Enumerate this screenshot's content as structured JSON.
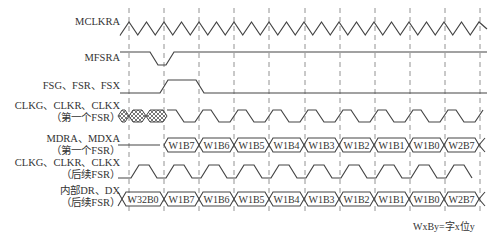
{
  "diagram": {
    "title": "",
    "colors": {
      "line": "#444444",
      "dash": "#777777",
      "hatch": "#555555",
      "background": "#ffffff"
    },
    "grid": {
      "dashed_x": [
        129,
        164,
        199,
        234,
        269,
        305,
        340,
        375,
        410,
        445,
        480
      ],
      "y_top": 8,
      "y_bottom": 214
    },
    "signals": [
      {
        "id": "mclkra",
        "label": "MCLKRA",
        "sublabel": "",
        "type": "triangle-clock",
        "label_y": 16
      },
      {
        "id": "mfsra",
        "label": "MFSRA",
        "sublabel": "",
        "type": "pulse-low",
        "label_y": 52
      },
      {
        "id": "fsg",
        "label": "FSG、FSR、FSX",
        "sublabel": "",
        "type": "pulse-high",
        "label_y": 80
      },
      {
        "id": "clk-first",
        "label": "CLKG、CLKR、CLKX",
        "sublabel": "（第一个FSR）",
        "type": "clock-hatched",
        "label_y": 100
      },
      {
        "id": "mdra",
        "label": "MDRA、MDXA",
        "sublabel": "（第一个FSR）",
        "type": "bus",
        "label_y": 136
      },
      {
        "id": "clk-later",
        "label": "CLKG、CLKR、CLKX",
        "sublabel": "（后续FSR）",
        "type": "clock",
        "label_y": 161
      },
      {
        "id": "internal-dr",
        "label": "内部DR、DX",
        "sublabel": "（后续FSR）",
        "type": "bus",
        "label_y": 188
      }
    ],
    "buses": {
      "mdra": {
        "idle_until_x": 164,
        "words": [
          "W1B7",
          "W1B6",
          "W1B5",
          "W1B4",
          "W1B3",
          "W1B2",
          "W1B1",
          "W1B0",
          "W2B7"
        ]
      },
      "internal_dr": {
        "words": [
          "W32B0",
          "W1B7",
          "W1B6",
          "W1B5",
          "W1B4",
          "W1B3",
          "W1B2",
          "W1B1",
          "W1B0",
          "W2B7"
        ]
      }
    },
    "legend_note": "WxBy=字x位y"
  }
}
